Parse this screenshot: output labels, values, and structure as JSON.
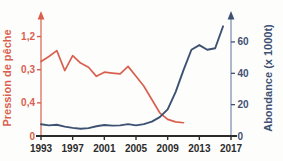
{
  "chart_data": {
    "type": "line",
    "title": "",
    "xlabel": "",
    "ylabel": "Pression de pêche",
    "y2label": "Abondance (x 1000t)",
    "grid": false,
    "legend": "none",
    "x": [
      1993,
      1994,
      1995,
      1996,
      1997,
      1998,
      1999,
      2000,
      2001,
      2002,
      2003,
      2004,
      2005,
      2006,
      2007,
      2008,
      2009,
      2010,
      2011
    ],
    "xlim": [
      1993,
      2017
    ],
    "xticks": [
      "1993",
      "1997",
      "2001",
      "2005",
      "2009",
      "2013",
      "2017"
    ],
    "xtick_values": [
      1993,
      1997,
      2001,
      2005,
      2009,
      2013,
      2017
    ],
    "ylim_left": [
      0,
      1.4
    ],
    "yticks_left": [
      "0",
      "0,4",
      "0,3",
      "1,2"
    ],
    "ytick_values_left": [
      0,
      0.4,
      0.8,
      1.2
    ],
    "ylim_right": [
      0,
      74
    ],
    "yticks_right": [
      "0",
      "20",
      "40",
      "60"
    ],
    "ytick_values_right": [
      0,
      20,
      40,
      60
    ],
    "series": [
      {
        "name": "Pression de pêche",
        "axis": "left",
        "color": "#d9604f",
        "x": [
          1993,
          1994,
          1995,
          1996,
          1997,
          1998,
          1999,
          2000,
          2001,
          2002,
          2003,
          2004,
          2005,
          2006,
          2007,
          2008,
          2009,
          2010,
          2011
        ],
        "values": [
          0.9,
          0.96,
          1.03,
          0.79,
          0.97,
          0.88,
          0.83,
          0.72,
          0.77,
          0.76,
          0.75,
          0.84,
          0.72,
          0.6,
          0.44,
          0.28,
          0.2,
          0.17,
          0.16
        ]
      },
      {
        "name": "Abondance",
        "axis": "right",
        "color": "#3d5273",
        "x": [
          1993,
          1994,
          1995,
          1996,
          1997,
          1998,
          1999,
          2000,
          2001,
          2002,
          2003,
          2004,
          2005,
          2006,
          2007,
          2008,
          2009,
          2010,
          2011,
          2012,
          2013,
          2014,
          2015,
          2016
        ],
        "values": [
          7.5,
          6.8,
          7.2,
          6.0,
          5.2,
          4.6,
          5.0,
          6.2,
          7.0,
          6.6,
          6.8,
          7.6,
          6.8,
          7.6,
          9.2,
          12.0,
          17.0,
          28.0,
          42.0,
          55.0,
          58.0,
          55.0,
          56.0,
          70.0
        ]
      }
    ],
    "colors": {
      "pressure": "#d9604f",
      "abundance": "#3d5273",
      "x_axis": "#2b2b2b",
      "background": "#fdfdfb"
    }
  }
}
